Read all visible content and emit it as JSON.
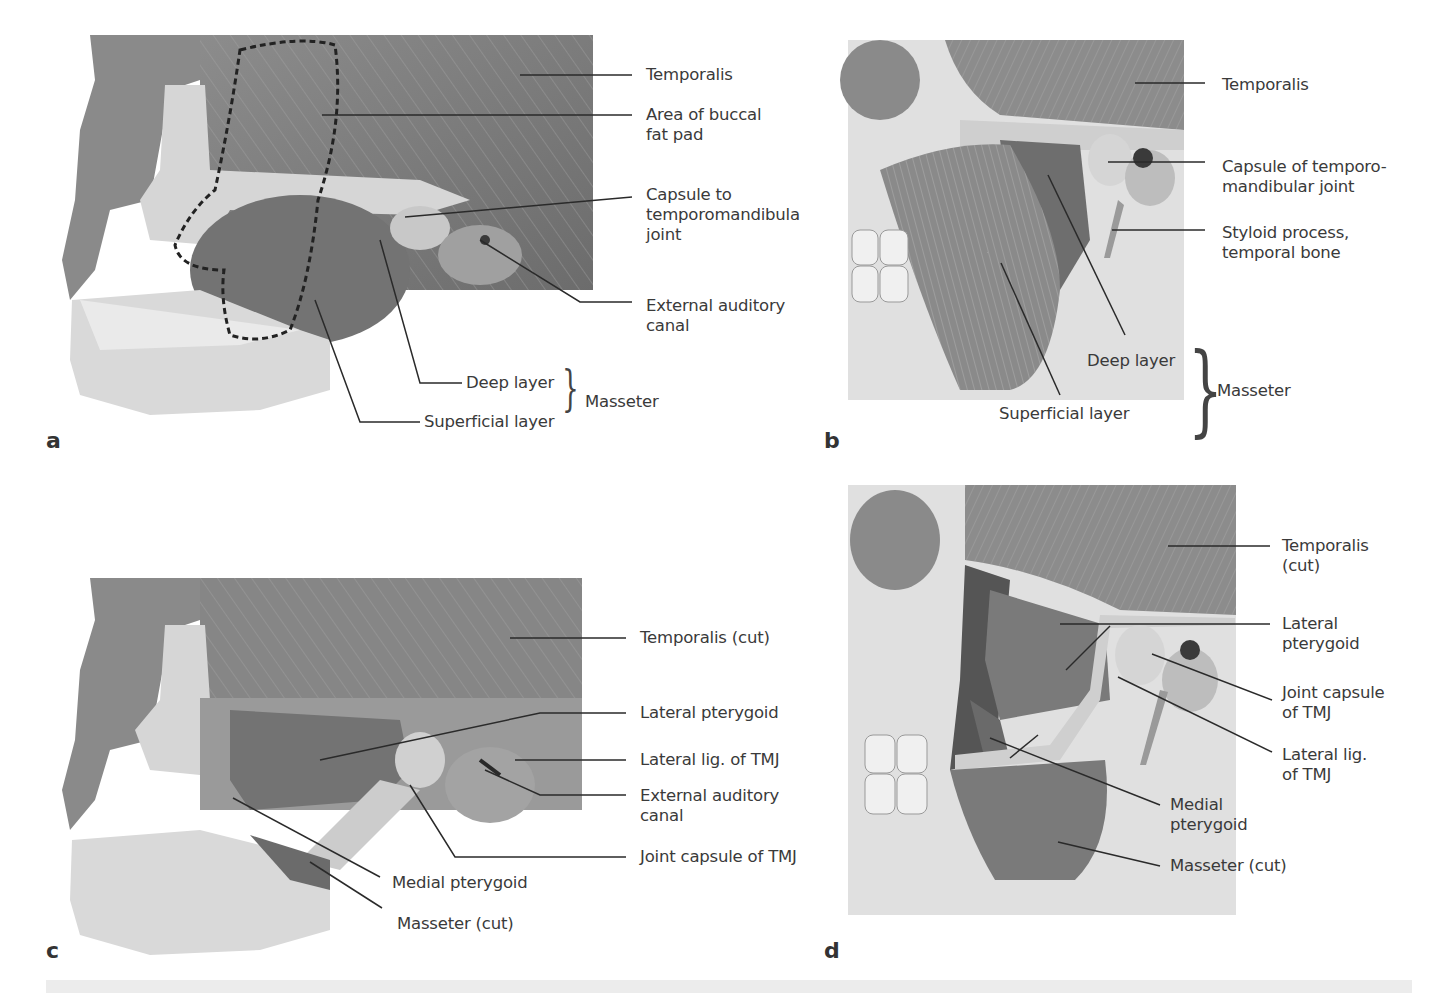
{
  "figure": {
    "panels": [
      {
        "id": "a",
        "letter": "a",
        "labels": {
          "temporalis": "Temporalis",
          "buccal_fat_pad": "Area of buccal\nfat pad",
          "capsule": "Capsule to\ntemporomandibula\njoint",
          "external_auditory_canal": "External auditory\ncanal",
          "deep_layer": "Deep layer",
          "superficial_layer": "Superficial layer",
          "masseter": "Masseter"
        }
      },
      {
        "id": "b",
        "letter": "b",
        "labels": {
          "temporalis": "Temporalis",
          "capsule": "Capsule of temporo-\nmandibular joint",
          "styloid": "Styloid process,\ntemporal bone",
          "deep_layer": "Deep layer",
          "superficial_layer": "Superficial layer",
          "masseter": "Masseter"
        }
      },
      {
        "id": "c",
        "letter": "c",
        "labels": {
          "temporalis_cut": "Temporalis (cut)",
          "lateral_pterygoid": "Lateral pterygoid",
          "lateral_lig": "Lateral lig. of TMJ",
          "external_auditory_canal": "External auditory\ncanal",
          "joint_capsule": "Joint capsule of TMJ",
          "medial_pterygoid": "Medial pterygoid",
          "masseter_cut": "Masseter (cut)"
        }
      },
      {
        "id": "d",
        "letter": "d",
        "labels": {
          "temporalis_cut": "Temporalis\n(cut)",
          "lateral_pterygoid": "Lateral\npterygoid",
          "joint_capsule": "Joint capsule\nof TMJ",
          "lateral_lig": "Lateral lig.\nof TMJ",
          "medial_pterygoid": "Medial\npterygoid",
          "masseter_cut": "Masseter (cut)"
        }
      }
    ],
    "colors": {
      "muscle": "#7d7d7d",
      "muscle_dark": "#5e5e5e",
      "bone": "#d9d9d9",
      "bone_light": "#ededed",
      "leader": "#2a2a2a",
      "footer_bar": "#ececec"
    }
  }
}
